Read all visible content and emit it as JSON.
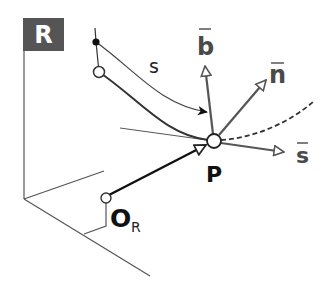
{
  "diagram": {
    "frame_label": "R",
    "origin_label": "O",
    "origin_subscript": "R",
    "point_label": "P",
    "arc_length_label": "s",
    "vectors": {
      "binormal": "b",
      "normal": "n",
      "tangent": "s"
    },
    "colors": {
      "frame_box": "#555555",
      "frame_text": "#ffffff",
      "axis": "#555555",
      "curve": "#333333",
      "vector": "#555555",
      "position_vector": "#111111"
    }
  }
}
